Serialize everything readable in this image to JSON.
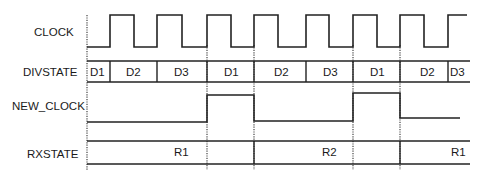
{
  "diagram": {
    "type": "timing-diagram",
    "signals": [
      {
        "name": "CLOCK",
        "kind": "clock"
      },
      {
        "name": "DIVSTATE",
        "kind": "bus",
        "segments": [
          "D1",
          "D2",
          "D3",
          "D1",
          "D2",
          "D3",
          "D1",
          "D2",
          "D3"
        ]
      },
      {
        "name": "NEW_CLOCK",
        "kind": "digital",
        "levels": [
          "low",
          "high",
          "low",
          "high",
          "low"
        ]
      },
      {
        "name": "RXSTATE",
        "kind": "bus",
        "segments": [
          "R1",
          "",
          "R2",
          "",
          "R1"
        ]
      }
    ]
  },
  "labels": {
    "clock": "CLOCK",
    "divstate": "DIVSTATE",
    "new_clock": "NEW_CLOCK",
    "rxstate": "RXSTATE"
  },
  "divstate": [
    "D1",
    "D2",
    "D3",
    "D1",
    "D2",
    "D3",
    "D1",
    "D2",
    "D3"
  ],
  "rxstate": [
    "R1",
    "R2",
    "R1"
  ]
}
